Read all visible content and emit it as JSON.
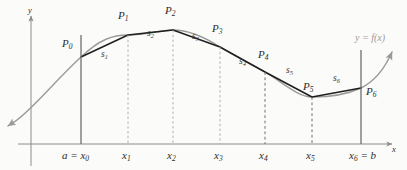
{
  "figure": {
    "background_color": "#fbfbf9",
    "curve_color": "#9a9a9a",
    "chord_color": "#1f1f1f",
    "axis_color": "#8c8c8c",
    "dashed_color": "#b0b0b0"
  },
  "axes": {
    "y_axis_label": "y",
    "x_axis_label": "x",
    "baseline_y": 144,
    "y_axis_x": 31
  },
  "curve": {
    "label": "y = f(x)",
    "label_x": 355,
    "label_y": 38
  },
  "points": [
    {
      "label": "P",
      "sub": "0",
      "x": 81,
      "y": 57,
      "label_x": 62,
      "label_y": 44
    },
    {
      "label": "P",
      "sub": "1",
      "x": 128,
      "y": 35,
      "label_x": 118,
      "label_y": 16
    },
    {
      "label": "P",
      "sub": "2",
      "x": 173,
      "y": 30,
      "label_x": 165,
      "label_y": 11
    },
    {
      "label": "P",
      "sub": "3",
      "x": 220,
      "y": 47,
      "label_x": 212,
      "label_y": 29
    },
    {
      "label": "P",
      "sub": "4",
      "x": 265,
      "y": 72,
      "label_x": 258,
      "label_y": 55
    },
    {
      "label": "P",
      "sub": "5",
      "x": 312,
      "y": 97,
      "label_x": 303,
      "label_y": 80
    },
    {
      "label": "P",
      "sub": "6",
      "x": 361,
      "y": 88,
      "label_x": 366,
      "label_y": 89
    }
  ],
  "segments": [
    {
      "label": "s",
      "sub": "1",
      "label_x": 101,
      "label_y": 55
    },
    {
      "label": "s",
      "sub": "2",
      "label_x": 147,
      "label_y": 34
    },
    {
      "label": "s",
      "sub": "3",
      "label_x": 192,
      "label_y": 37
    },
    {
      "label": "s",
      "sub": "4",
      "label_x": 239,
      "label_y": 62
    },
    {
      "label": "s",
      "sub": "5",
      "label_x": 286,
      "label_y": 72
    },
    {
      "label": "s",
      "sub": "6",
      "label_x": 333,
      "label_y": 80
    }
  ],
  "ticks": [
    {
      "text_before": "a = x",
      "sub": "0",
      "text_after": "",
      "x": 81,
      "label_x": 62,
      "label_y": 150,
      "line_style": "solid"
    },
    {
      "text_before": "x",
      "sub": "1",
      "text_after": "",
      "x": 128,
      "label_x": 122,
      "label_y": 150,
      "line_style": "dashed"
    },
    {
      "text_before": "x",
      "sub": "2",
      "text_after": "",
      "x": 173,
      "label_x": 167,
      "label_y": 150,
      "line_style": "dashed"
    },
    {
      "text_before": "x",
      "sub": "3",
      "text_after": "",
      "x": 220,
      "label_x": 214,
      "label_y": 150,
      "line_style": "dashed"
    },
    {
      "text_before": "x",
      "sub": "4",
      "text_after": "",
      "x": 265,
      "label_x": 259,
      "label_y": 150,
      "line_style": "dashed"
    },
    {
      "text_before": "x",
      "sub": "5",
      "text_after": "",
      "x": 312,
      "label_x": 306,
      "label_y": 150,
      "line_style": "dashed"
    },
    {
      "text_before": "x",
      "sub": "6",
      "text_after": " = b",
      "x": 361,
      "label_x": 349,
      "label_y": 150,
      "line_style": "solid"
    }
  ]
}
